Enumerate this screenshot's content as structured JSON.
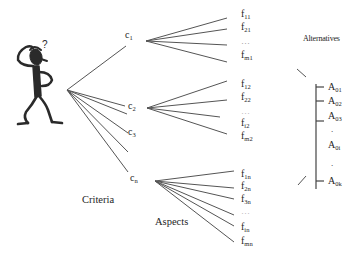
{
  "diagram": {
    "labels": {
      "criteria": "Criteria",
      "aspects": "Aspects",
      "alternatives": "Alternatives",
      "question_mark": "?"
    },
    "criteria": [
      {
        "base": "c",
        "sub": "1"
      },
      {
        "base": "c",
        "sub": "2"
      },
      {
        "base": "c",
        "sub": "3"
      },
      {
        "base": "c",
        "sub": "n"
      }
    ],
    "aspects": {
      "c1": [
        {
          "base": "f",
          "sub": "11"
        },
        {
          "base": "f",
          "sub": "21"
        },
        {
          "base": "…",
          "sub": ""
        },
        {
          "base": "f",
          "sub": "m1"
        }
      ],
      "c2": [
        {
          "base": "f",
          "sub": "12"
        },
        {
          "base": "f",
          "sub": "22"
        },
        {
          "base": "…",
          "sub": ""
        },
        {
          "base": "f",
          "sub": "i2"
        },
        {
          "base": "f",
          "sub": "m2"
        }
      ],
      "cn": [
        {
          "base": "f",
          "sub": "1n"
        },
        {
          "base": "f",
          "sub": "2n"
        },
        {
          "base": "f",
          "sub": "3n"
        },
        {
          "base": "…",
          "sub": ""
        },
        {
          "base": "f",
          "sub": "in"
        },
        {
          "base": "f",
          "sub": "mn"
        }
      ]
    },
    "alternatives": [
      {
        "base": "A",
        "sub": "01"
      },
      {
        "base": "A",
        "sub": "02"
      },
      {
        "base": "A",
        "sub": "03"
      },
      {
        "base": ".",
        "sub": ""
      },
      {
        "base": "A",
        "sub": "0i"
      },
      {
        "base": ".",
        "sub": ""
      },
      {
        "base": "A",
        "sub": "0k"
      }
    ],
    "colors": {
      "line": "#555555",
      "figure": "#2a2a2a",
      "text": "#1e1e1e"
    }
  }
}
